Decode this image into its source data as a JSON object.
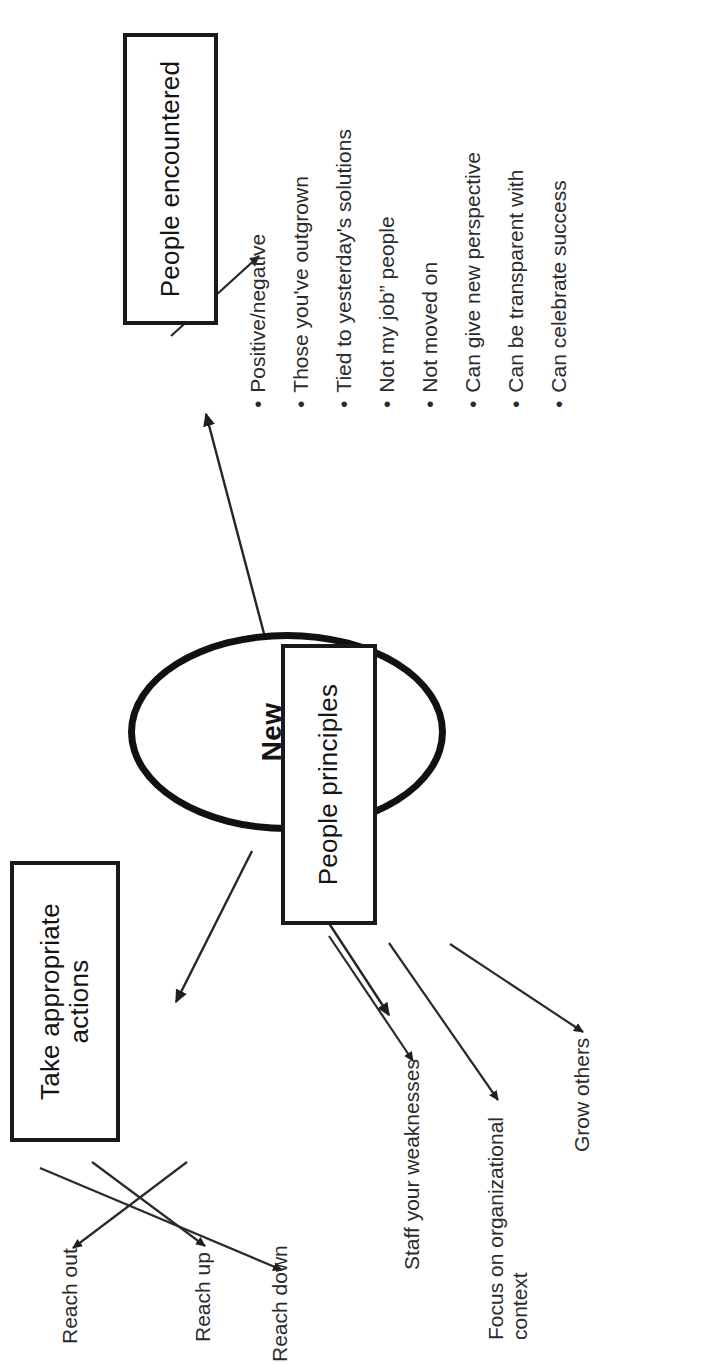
{
  "diagram": {
    "title_node": {
      "label": "New\nPeople",
      "shape": "ellipse"
    },
    "nodes": [
      {
        "id": "take-appropriate-actions",
        "label": "Take appropriate\nactions",
        "shape": "rect"
      },
      {
        "id": "people-principles",
        "label": "People principles",
        "shape": "rect"
      },
      {
        "id": "people-encountered",
        "label": "People encountered",
        "shape": "rect"
      }
    ],
    "leaves": {
      "reach_out": "Reach out",
      "reach_up": "Reach up",
      "reach_down": "Reach down",
      "grow_others": "Grow others",
      "focus_on_organizational_context": "Focus on organizational\ncontext",
      "staff_your_weaknesses": "Staff your weaknesses"
    },
    "bullet_list": {
      "source": "people-encountered",
      "items": [
        "Positive/negative",
        "Those you've outgrown",
        "Tied to yesterday's solutions",
        "Not my job” people",
        "Not moved on",
        "Can give new perspective",
        "Can be transparent with",
        "Can celebrate success"
      ],
      "marker": "•"
    },
    "colors": {
      "ink": "#1a1a1a",
      "text": "#2b2b2b",
      "background": "#ffffff",
      "edge": "#2b2b2b"
    }
  }
}
